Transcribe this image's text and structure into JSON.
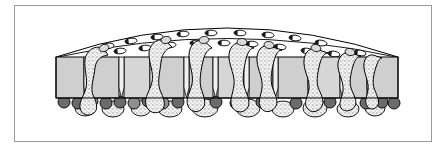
{
  "figure": {
    "domain_label": "Diagram",
    "title": "",
    "caption": "",
    "width": 446,
    "height": 150,
    "background_color": "#ffffff",
    "style": "black-and-white line drawing with flat gray fills and stippled texture"
  },
  "frame": {
    "name": "figure-border",
    "x": 14,
    "y": 5,
    "width": 418,
    "height": 137,
    "stroke_color": "#9a9a9a",
    "stroke_width": 1,
    "fill": "none"
  },
  "colors": {
    "outline": "#000000",
    "cell_fill": "#cfcfcf",
    "cell_fill_light": "#dddddd",
    "lumen_fill": "#ffffff",
    "basal_cell_fill": "#6b6b6b",
    "basal_cell_fill_dark": "#4f4f4f",
    "migrating_cell_fill": "#f2f2f2",
    "stipple_color": "#8a8a8a",
    "frame_stroke": "#9a9a9a"
  },
  "structures": {
    "dome": {
      "name": "apical-lumen-dome",
      "description": "curved white apical surface arching over the cell layer",
      "left_x": 56,
      "right_x": 398,
      "apex_y": 28,
      "base_y": 57,
      "fill": "#ffffff",
      "stroke": "#000000"
    },
    "epithelium": {
      "name": "columnar-cell-layer",
      "top_y": 57,
      "bottom_y": 98,
      "left_x": 56,
      "right_x": 398,
      "fill": "#cfcfcf",
      "cell_count": 11
    },
    "basal_row": {
      "name": "basal-cell-row",
      "center_y": 102,
      "radius": 6,
      "count": 17,
      "fill": "#6b6b6b"
    }
  },
  "cell_blocks": [
    {
      "id": 1,
      "x": 56,
      "width": 28,
      "fill": "#cfcfcf"
    },
    {
      "id": 2,
      "x": 89,
      "width": 30,
      "fill": "#cfcfcf"
    },
    {
      "id": 3,
      "x": 124,
      "width": 26,
      "fill": "#d6d6d6"
    },
    {
      "id": 4,
      "x": 155,
      "width": 29,
      "fill": "#cfcfcf"
    },
    {
      "id": 5,
      "x": 189,
      "width": 24,
      "fill": "#cfcfcf"
    },
    {
      "id": 6,
      "x": 218,
      "width": 26,
      "fill": "#d6d6d6"
    },
    {
      "id": 7,
      "x": 249,
      "width": 24,
      "fill": "#cfcfcf"
    },
    {
      "id": 8,
      "x": 278,
      "width": 30,
      "fill": "#cfcfcf"
    },
    {
      "id": 9,
      "x": 313,
      "width": 27,
      "fill": "#d6d6d6"
    },
    {
      "id": 10,
      "x": 345,
      "width": 22,
      "fill": "#cfcfcf"
    },
    {
      "id": 11,
      "x": 372,
      "width": 26,
      "fill": "#cfcfcf"
    }
  ],
  "lumen_particles": [
    {
      "cx": 108,
      "cy": 46,
      "rx": 6.0,
      "ry": 2.8,
      "angle": -8
    },
    {
      "cx": 131,
      "cy": 41,
      "rx": 6.0,
      "ry": 2.8,
      "angle": -6
    },
    {
      "cx": 157,
      "cy": 37,
      "rx": 6.0,
      "ry": 2.8,
      "angle": -4
    },
    {
      "cx": 183,
      "cy": 34,
      "rx": 6.0,
      "ry": 2.8,
      "angle": -3
    },
    {
      "cx": 211,
      "cy": 33,
      "rx": 6.0,
      "ry": 2.8,
      "angle": 0
    },
    {
      "cx": 240,
      "cy": 33,
      "rx": 6.0,
      "ry": 2.8,
      "angle": 2
    },
    {
      "cx": 268,
      "cy": 35,
      "rx": 6.0,
      "ry": 2.8,
      "angle": 4
    },
    {
      "cx": 295,
      "cy": 38,
      "rx": 6.0,
      "ry": 2.8,
      "angle": 6
    },
    {
      "cx": 321,
      "cy": 43,
      "rx": 6.0,
      "ry": 2.8,
      "angle": 8
    },
    {
      "cx": 96,
      "cy": 53,
      "rx": 6.0,
      "ry": 2.8,
      "angle": -6
    },
    {
      "cx": 120,
      "cy": 51,
      "rx": 6.0,
      "ry": 2.8,
      "angle": -5
    },
    {
      "cx": 145,
      "cy": 48,
      "rx": 6.0,
      "ry": 2.8,
      "angle": -4
    },
    {
      "cx": 170,
      "cy": 45,
      "rx": 6.0,
      "ry": 2.8,
      "angle": -3
    },
    {
      "cx": 196,
      "cy": 43,
      "rx": 6.0,
      "ry": 2.8,
      "angle": -1
    },
    {
      "cx": 224,
      "cy": 43,
      "rx": 6.0,
      "ry": 2.8,
      "angle": 1
    },
    {
      "cx": 252,
      "cy": 44,
      "rx": 6.0,
      "ry": 2.8,
      "angle": 3
    },
    {
      "cx": 280,
      "cy": 47,
      "rx": 6.0,
      "ry": 2.8,
      "angle": 5
    },
    {
      "cx": 307,
      "cy": 51,
      "rx": 6.0,
      "ry": 2.8,
      "angle": 7
    },
    {
      "cx": 334,
      "cy": 54,
      "rx": 6.0,
      "ry": 2.8,
      "angle": 9
    },
    {
      "cx": 360,
      "cy": 53,
      "rx": 6.0,
      "ry": 2.8,
      "angle": 9
    }
  ],
  "migrating_cells": [
    {
      "id": 1,
      "label": "migrating-cell-1",
      "apex_x": 105,
      "base_x": 86,
      "description": "leukocyte squeezing between cells 1 and 2"
    },
    {
      "id": 2,
      "label": "migrating-cell-2",
      "apex_x": 168,
      "base_x": 151,
      "description": "leukocyte squeezing between cells 3 and 4"
    },
    {
      "id": 3,
      "label": "migrating-cell-3",
      "apex_x": 206,
      "base_x": 190,
      "description": "leukocyte in intercellular space 4-5"
    },
    {
      "id": 4,
      "label": "migrating-cell-4",
      "apex_x": 244,
      "base_x": 248,
      "description": "leukocyte in intercellular space 6-7"
    },
    {
      "id": 5,
      "label": "migrating-cell-5",
      "apex_x": 272,
      "base_x": 276,
      "description": "leukocyte in intercellular space 7-8"
    },
    {
      "id": 6,
      "label": "migrating-cell-6",
      "apex_x": 318,
      "base_x": 310,
      "description": "leukocyte in intercellular space 8-9"
    },
    {
      "id": 7,
      "label": "migrating-cell-7",
      "apex_x": 352,
      "base_x": 345,
      "description": "leukocyte in intercellular space 9-10"
    },
    {
      "id": 8,
      "label": "migrating-cell-8",
      "apex_x": 375,
      "base_x": 370,
      "description": "leukocyte in intercellular space 10-11"
    }
  ],
  "basal_cells": [
    {
      "cx": 64,
      "cy": 102,
      "r": 6,
      "shade": "dark"
    },
    {
      "cx": 78,
      "cy": 103,
      "r": 6,
      "shade": "dark"
    },
    {
      "cx": 92,
      "cy": 101,
      "r": 6,
      "shade": "light"
    },
    {
      "cx": 106,
      "cy": 103,
      "r": 6,
      "shade": "dark"
    },
    {
      "cx": 120,
      "cy": 102,
      "r": 6,
      "shade": "dark"
    },
    {
      "cx": 134,
      "cy": 103,
      "r": 6,
      "shade": "light"
    },
    {
      "cx": 148,
      "cy": 101,
      "r": 6,
      "shade": "dark"
    },
    {
      "cx": 163,
      "cy": 103,
      "r": 6,
      "shade": "light"
    },
    {
      "cx": 178,
      "cy": 102,
      "r": 6,
      "shade": "dark"
    },
    {
      "cx": 196,
      "cy": 103,
      "r": 6,
      "shade": "dark"
    },
    {
      "cx": 216,
      "cy": 102,
      "r": 6,
      "shade": "dark"
    },
    {
      "cx": 236,
      "cy": 103,
      "r": 6,
      "shade": "dark"
    },
    {
      "cx": 262,
      "cy": 102,
      "r": 6,
      "shade": "dark"
    },
    {
      "cx": 296,
      "cy": 103,
      "r": 6,
      "shade": "dark"
    },
    {
      "cx": 330,
      "cy": 102,
      "r": 6,
      "shade": "dark"
    },
    {
      "cx": 366,
      "cy": 103,
      "r": 6,
      "shade": "dark"
    },
    {
      "cx": 382,
      "cy": 102,
      "r": 6,
      "shade": "dark"
    },
    {
      "cx": 394,
      "cy": 103,
      "r": 6,
      "shade": "dark"
    }
  ],
  "basal_blobs": [
    {
      "cx": 85,
      "cy": 108,
      "rx": 10,
      "ry": 8
    },
    {
      "cx": 113,
      "cy": 109,
      "rx": 11,
      "ry": 8
    },
    {
      "cx": 141,
      "cy": 108,
      "rx": 10,
      "ry": 8
    },
    {
      "cx": 170,
      "cy": 109,
      "rx": 12,
      "ry": 8
    },
    {
      "cx": 205,
      "cy": 108,
      "rx": 13,
      "ry": 9
    },
    {
      "cx": 248,
      "cy": 108,
      "rx": 12,
      "ry": 9
    },
    {
      "cx": 283,
      "cy": 109,
      "rx": 11,
      "ry": 8
    },
    {
      "cx": 315,
      "cy": 108,
      "rx": 12,
      "ry": 9
    },
    {
      "cx": 348,
      "cy": 109,
      "rx": 11,
      "ry": 8
    },
    {
      "cx": 375,
      "cy": 108,
      "rx": 10,
      "ry": 8
    }
  ]
}
